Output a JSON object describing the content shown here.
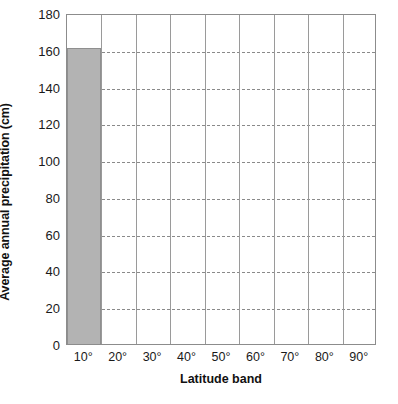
{
  "chart_data": {
    "type": "bar",
    "title": "",
    "xlabel": "Latitude band",
    "ylabel": "Average annual precipitation (cm)",
    "categories": [
      "10°",
      "20°",
      "30°",
      "40°",
      "50°",
      "60°",
      "70°",
      "80°",
      "90°"
    ],
    "values": [
      161,
      null,
      null,
      null,
      null,
      null,
      null,
      null,
      null
    ],
    "ylim": [
      0,
      180
    ],
    "ytick_values": [
      0,
      20,
      40,
      60,
      80,
      100,
      120,
      140,
      160,
      180
    ],
    "ytick_labels": [
      "0",
      "20",
      "40",
      "60",
      "80",
      "100",
      "120",
      "140",
      "160",
      "180"
    ],
    "grid": {
      "horizontal": "dashed",
      "vertical": "solid"
    },
    "legend": null,
    "bar_color": "#b3b3b3",
    "bar_edge_color": "#8f8f8f",
    "axis_color": "#8c8c8c",
    "grid_color": "#8a8a8a",
    "text_color": "#1a1a1a"
  }
}
